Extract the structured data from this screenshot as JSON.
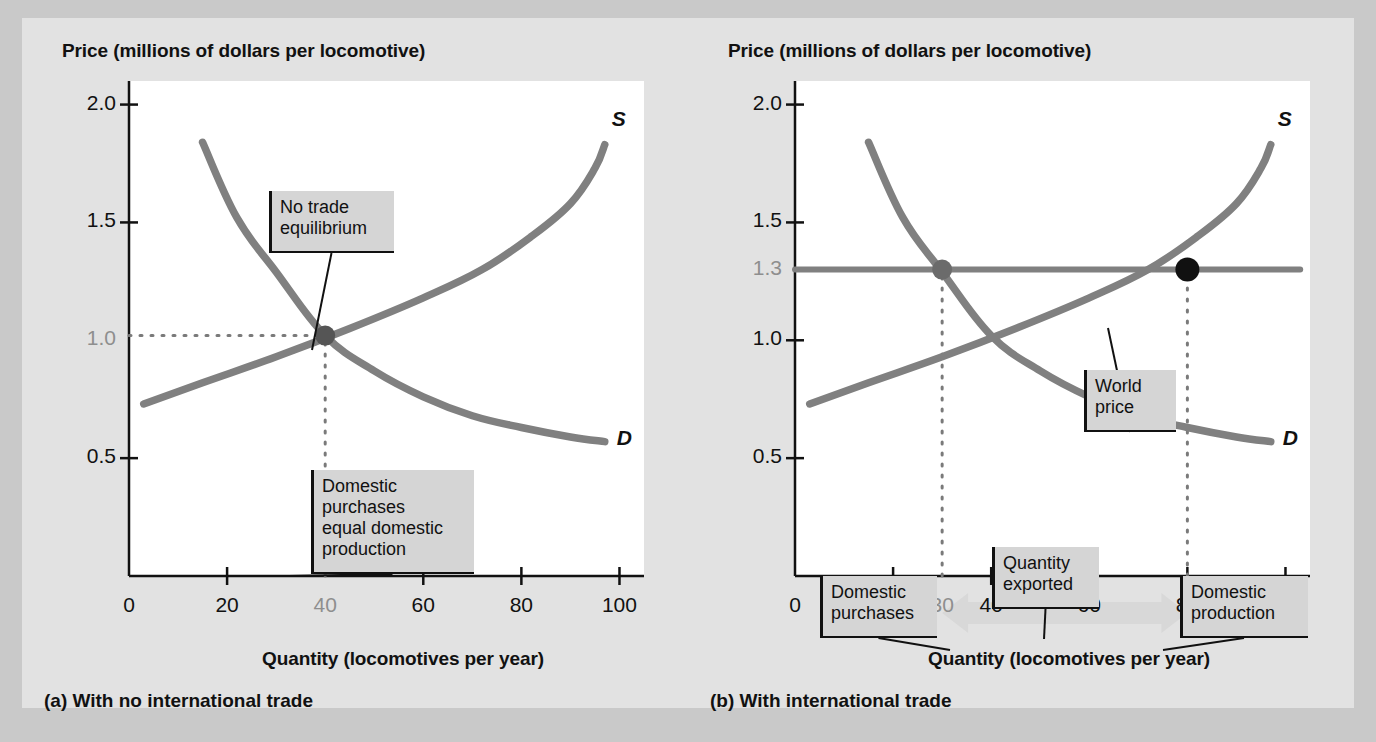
{
  "figure": {
    "background_color": "#c9c9c9",
    "panel_background_color": "#e2e2e2",
    "plot_background_color": "#ffffff",
    "curve_color": "#808080",
    "accent_dark": "#555555",
    "accent_black": "#111111",
    "muted_label_color": "#8e8e8e",
    "arrow_color": "#d8d8d8"
  },
  "chart_data": [
    {
      "type": "line",
      "panel_id": "a",
      "title": "(a) With no international trade",
      "ylabel": "Price (millions of dollars per locomotive)",
      "xlabel": "Quantity (locomotives per year)",
      "xlim": [
        0,
        105
      ],
      "ylim": [
        0,
        2.1
      ],
      "grid": false,
      "legend_position": "inline-curve-labels",
      "xticks": [
        {
          "value": 0,
          "label": "0",
          "muted": false,
          "mark": false
        },
        {
          "value": 20,
          "label": "20",
          "muted": false,
          "mark": true
        },
        {
          "value": 40,
          "label": "40",
          "muted": true,
          "mark": false
        },
        {
          "value": 60,
          "label": "60",
          "muted": false,
          "mark": true
        },
        {
          "value": 80,
          "label": "80",
          "muted": false,
          "mark": true
        },
        {
          "value": 100,
          "label": "100",
          "muted": false,
          "mark": true
        }
      ],
      "yticks": [
        {
          "value": 0.5,
          "label": "0.5",
          "muted": false,
          "mark": true
        },
        {
          "value": 1.0,
          "label": "1.0",
          "muted": true,
          "mark": false
        },
        {
          "value": 1.5,
          "label": "1.5",
          "muted": false,
          "mark": true
        },
        {
          "value": 2.0,
          "label": "2.0",
          "muted": false,
          "mark": true
        }
      ],
      "series": [
        {
          "name": "S",
          "label": "S",
          "kind": "supply",
          "points": [
            [
              3,
              0.73
            ],
            [
              15,
              0.82
            ],
            [
              30,
              0.93
            ],
            [
              45,
              1.05
            ],
            [
              60,
              1.18
            ],
            [
              72,
              1.3
            ],
            [
              82,
              1.44
            ],
            [
              90,
              1.58
            ],
            [
              95,
              1.73
            ],
            [
              97,
              1.83
            ]
          ]
        },
        {
          "name": "D",
          "label": "D",
          "kind": "demand",
          "points": [
            [
              15,
              1.84
            ],
            [
              22,
              1.52
            ],
            [
              30,
              1.29
            ],
            [
              40,
              1.02
            ],
            [
              50,
              0.87
            ],
            [
              60,
              0.76
            ],
            [
              70,
              0.68
            ],
            [
              80,
              0.63
            ],
            [
              90,
              0.59
            ],
            [
              97,
              0.57
            ]
          ]
        }
      ],
      "markers": [
        {
          "name": "no-trade-equilibrium",
          "x": 40,
          "y": 1.02,
          "color": "#555555",
          "radius": 10
        }
      ],
      "guide_lines": [
        {
          "name": "equilibrium-price-guide",
          "orientation": "horizontal",
          "y": 1.02,
          "from_x": 0,
          "to_x": 40,
          "style": "dotted"
        },
        {
          "name": "equilibrium-quantity-guide",
          "orientation": "vertical",
          "x": 40,
          "from_y": 0,
          "to_y": 1.02,
          "style": "dotted"
        }
      ],
      "annotations": [
        {
          "name": "no-trade-equilibrium-callout",
          "text": "No trade\nequilibrium",
          "box": {
            "left": 163,
            "top": 110,
            "width": 125,
            "height": 62
          },
          "leader_to": {
            "x": 206,
            "y": 269
          }
        },
        {
          "name": "domestic-equals-production-callout",
          "text": "Domestic\npurchases\nequal domestic\nproduction",
          "box": {
            "left": 205,
            "top": 389,
            "width": 163,
            "height": 104
          },
          "leader_to": {
            "x": 183,
            "y": 495
          }
        }
      ]
    },
    {
      "type": "line",
      "panel_id": "b",
      "title": "(b) With international trade",
      "ylabel": "Price (millions of dollars per locomotive)",
      "xlabel": "Quantity (locomotives per year)",
      "xlim": [
        0,
        105
      ],
      "ylim": [
        0,
        2.1
      ],
      "grid": false,
      "legend_position": "inline-curve-labels",
      "xticks": [
        {
          "value": 0,
          "label": "0",
          "muted": false,
          "mark": false
        },
        {
          "value": 20,
          "label": "20",
          "muted": false,
          "mark": true
        },
        {
          "value": 30,
          "label": "30",
          "muted": true,
          "mark": false
        },
        {
          "value": 40,
          "label": "40",
          "muted": false,
          "mark": true
        },
        {
          "value": 60,
          "label": "60",
          "muted": false,
          "mark": true
        },
        {
          "value": 80,
          "label": "80",
          "muted": false,
          "mark": true
        },
        {
          "value": 100,
          "label": "100",
          "muted": false,
          "mark": true
        }
      ],
      "yticks": [
        {
          "value": 0.5,
          "label": "0.5",
          "muted": false,
          "mark": true
        },
        {
          "value": 1.0,
          "label": "1.0",
          "muted": false,
          "mark": true
        },
        {
          "value": 1.3,
          "label": "1.3",
          "muted": true,
          "mark": false
        },
        {
          "value": 1.5,
          "label": "1.5",
          "muted": false,
          "mark": true
        },
        {
          "value": 2.0,
          "label": "2.0",
          "muted": false,
          "mark": true
        }
      ],
      "series": [
        {
          "name": "S",
          "label": "S",
          "kind": "supply",
          "points": [
            [
              3,
              0.73
            ],
            [
              15,
              0.82
            ],
            [
              30,
              0.93
            ],
            [
              45,
              1.05
            ],
            [
              60,
              1.18
            ],
            [
              72,
              1.3
            ],
            [
              82,
              1.44
            ],
            [
              90,
              1.58
            ],
            [
              95,
              1.73
            ],
            [
              97,
              1.83
            ]
          ]
        },
        {
          "name": "D",
          "label": "D",
          "kind": "demand",
          "points": [
            [
              15,
              1.84
            ],
            [
              22,
              1.52
            ],
            [
              30,
              1.29
            ],
            [
              40,
              1.02
            ],
            [
              50,
              0.87
            ],
            [
              60,
              0.76
            ],
            [
              70,
              0.68
            ],
            [
              80,
              0.63
            ],
            [
              90,
              0.59
            ],
            [
              97,
              0.57
            ]
          ]
        },
        {
          "name": "World price",
          "label": "",
          "kind": "world-price-line",
          "points": [
            [
              0,
              1.3
            ],
            [
              103,
              1.3
            ]
          ]
        }
      ],
      "markers": [
        {
          "name": "domestic-purchases-point",
          "x": 30,
          "y": 1.3,
          "color": "#6b6b6b",
          "radius": 10
        },
        {
          "name": "domestic-production-point",
          "x": 80,
          "y": 1.3,
          "color": "#111111",
          "radius": 12
        }
      ],
      "guide_lines": [
        {
          "name": "domestic-purchases-guide",
          "orientation": "vertical",
          "x": 30,
          "from_y": 0,
          "to_y": 1.3,
          "style": "dotted"
        },
        {
          "name": "domestic-production-guide",
          "orientation": "vertical",
          "x": 80,
          "from_y": 0,
          "to_y": 1.3,
          "style": "dotted"
        }
      ],
      "arrows": [
        {
          "name": "quantity-exported-arrow",
          "from_x": 30,
          "to_x": 80,
          "y_px": 532,
          "color": "#d8d8d8",
          "double_headed": true
        }
      ],
      "annotations": [
        {
          "name": "world-price-callout",
          "text": "World\nprice",
          "box": {
            "left": 312,
            "top": 289,
            "width": 92,
            "height": 62
          },
          "leader_to": {
            "x": 336,
            "y": 247
          }
        },
        {
          "name": "domestic-purchases-callout",
          "text": "Domestic\npurchases",
          "box": {
            "left": 48,
            "top": 495,
            "width": 117,
            "height": 62
          },
          "leader_to": {
            "x": 178,
            "y": 569
          }
        },
        {
          "name": "quantity-exported-callout",
          "text": "Quantity\nexported",
          "box": {
            "left": 220,
            "top": 466,
            "width": 107,
            "height": 62
          },
          "leader_to": {
            "x": 272,
            "y": 558
          }
        },
        {
          "name": "domestic-production-callout",
          "text": "Domestic\nproduction",
          "box": {
            "left": 408,
            "top": 495,
            "width": 128,
            "height": 62
          },
          "leader_to": {
            "x": 391,
            "y": 569
          }
        }
      ]
    }
  ]
}
